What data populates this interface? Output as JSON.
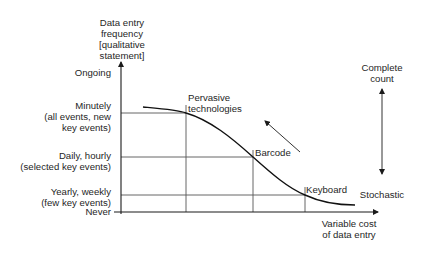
{
  "diagram": {
    "y_axis": {
      "title_lines": [
        "Data entry",
        "frequency",
        "[qualitative",
        "statement]"
      ],
      "levels": [
        {
          "id": "ongoing",
          "lines": [
            "Ongoing"
          ]
        },
        {
          "id": "minutely",
          "lines": [
            "Minutely",
            "(all events, new",
            "key events)"
          ]
        },
        {
          "id": "daily",
          "lines": [
            "Daily, hourly",
            "(selected key events)"
          ]
        },
        {
          "id": "yearly",
          "lines": [
            "Yearly, weekly",
            "(few key events)"
          ]
        },
        {
          "id": "never",
          "lines": [
            "Never"
          ]
        }
      ]
    },
    "x_axis": {
      "title_lines": [
        "Variable cost",
        "of data entry"
      ]
    },
    "technologies": [
      {
        "id": "pervasive",
        "lines": [
          "Pervasive",
          "technologies"
        ],
        "level": "minutely"
      },
      {
        "id": "barcode",
        "lines": [
          "Barcode"
        ],
        "level": "daily"
      },
      {
        "id": "keyboard",
        "lines": [
          "Keyboard"
        ],
        "level": "yearly"
      }
    ],
    "scale": {
      "top_lines": [
        "Complete",
        "count"
      ],
      "bottom_lines": [
        "Stochastic"
      ]
    },
    "colors": {
      "axis": "#1a1a1a",
      "grid": "#555555",
      "curve": "#111111",
      "text": "#262626"
    }
  }
}
